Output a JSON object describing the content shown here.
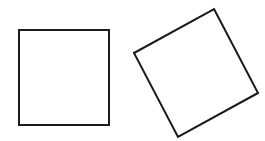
{
  "diagram": {
    "background": "#ffffff",
    "stroke_color": "#1a1a1a",
    "shapes": [
      {
        "name": "upright-square",
        "type": "square",
        "points": "19,30 109,30 109,125 19,125",
        "stroke_width": 2
      },
      {
        "name": "rotated-square",
        "type": "square",
        "rotation_deg": -27,
        "points": "214,9 258,93 178,137 134,53",
        "stroke_width": 2
      }
    ]
  }
}
